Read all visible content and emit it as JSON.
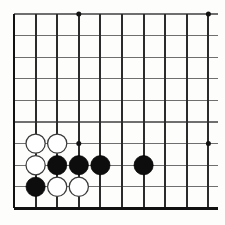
{
  "board": {
    "title": "Go Board Diagram",
    "game": "Go",
    "colors": {
      "background": "#fdfdfb",
      "vertical_line": "#2b2b2b",
      "horizontal_line": "#6f6f6f",
      "edge_line": "#111111",
      "black_stone": "#0d0d0d",
      "white_stone": "#ffffff",
      "white_stone_outline": "#3a3a3a",
      "star_point": "#111111"
    },
    "geometry": {
      "cols": 10,
      "rows": 10,
      "origin_x": 14,
      "origin_y": 14,
      "spacing": 21.6,
      "stone_radius": 9.6,
      "star_radius": 2.5
    },
    "edges": {
      "left_bold": true,
      "bottom_bold": true,
      "top_bold": false,
      "right_bold": false
    },
    "star_points": [
      {
        "col": 3,
        "row": 0
      },
      {
        "col": 9,
        "row": 0
      },
      {
        "col": 3,
        "row": 6
      },
      {
        "col": 9,
        "row": 6
      }
    ],
    "stones": [
      {
        "col": 1,
        "row": 6,
        "color": "white",
        "label": "white-stone-c1r6"
      },
      {
        "col": 2,
        "row": 6,
        "color": "white",
        "label": "white-stone-c2r6"
      },
      {
        "col": 1,
        "row": 7,
        "color": "white",
        "label": "white-stone-c1r7"
      },
      {
        "col": 2,
        "row": 7,
        "color": "black",
        "label": "black-stone-c2r7"
      },
      {
        "col": 3,
        "row": 7,
        "color": "black",
        "label": "black-stone-c3r7"
      },
      {
        "col": 4,
        "row": 7,
        "color": "black",
        "label": "black-stone-c4r7"
      },
      {
        "col": 6,
        "row": 7,
        "color": "black",
        "label": "black-stone-c6r7"
      },
      {
        "col": 1,
        "row": 8,
        "color": "black",
        "label": "black-stone-c1r8"
      },
      {
        "col": 2,
        "row": 8,
        "color": "white",
        "label": "white-stone-c2r8"
      },
      {
        "col": 3,
        "row": 8,
        "color": "white",
        "label": "white-stone-c3r8"
      }
    ],
    "counts": {
      "black_stones": 5,
      "white_stones": 5,
      "total_stones": 10
    }
  }
}
